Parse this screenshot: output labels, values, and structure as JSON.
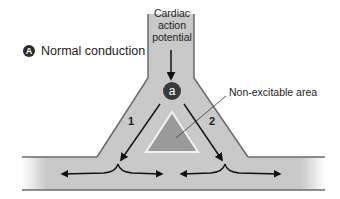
{
  "panel": {
    "badge": "A",
    "title": "Normal conduction"
  },
  "stem_label": [
    "Cardiac",
    "action",
    "potential"
  ],
  "node_label": "a",
  "pathways": [
    {
      "label": "1"
    },
    {
      "label": "2"
    }
  ],
  "non_excitable_label": "Non-excitable area",
  "colors": {
    "tissue": "#c9c9c9",
    "border": "#6a6a6a",
    "non_excitable": "#9a9a9a",
    "arrow": "#111111",
    "node": "#3a3a3a"
  }
}
